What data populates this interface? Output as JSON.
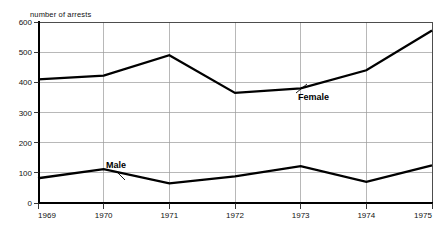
{
  "chart_data": {
    "type": "line",
    "title": "number of arrests",
    "xlabel": "",
    "ylabel": "number of arrests",
    "categories": [
      "1969",
      "1970",
      "1971",
      "1972",
      "1973",
      "1974",
      "1975"
    ],
    "x": [
      1969,
      1970,
      1971,
      1972,
      1973,
      1974,
      1975
    ],
    "xlim": [
      1969,
      1975
    ],
    "ylim": [
      0,
      600
    ],
    "yticks": [
      0,
      100,
      200,
      300,
      400,
      500,
      600
    ],
    "ytick_labels": [
      "0",
      "100",
      "200",
      "300",
      "400",
      "500",
      "600"
    ],
    "xtick_labels": [
      "1969",
      "1970",
      "1971",
      "1972",
      "1973",
      "1974",
      "1975"
    ],
    "grid": true,
    "legend": "inline-annotations",
    "series": [
      {
        "name": "Female",
        "label": "Female",
        "color": "#000000",
        "values": [
          410,
          422,
          490,
          365,
          380,
          440,
          572
        ],
        "annotation": {
          "text": "Female",
          "x_px": 298,
          "y_px": 100,
          "leader_from_x_px": 296,
          "leader_from_y_px": 93,
          "leader_to_x_px": 307,
          "leader_to_y_px": 84
        }
      },
      {
        "name": "Male",
        "label": "Male",
        "color": "#000000",
        "values": [
          82,
          112,
          65,
          88,
          122,
          70,
          125
        ],
        "annotation": {
          "text": "Male",
          "x_px": 106,
          "y_px": 168,
          "leader_from_x_px": 116,
          "leader_from_y_px": 171,
          "leader_to_x_px": 125,
          "leader_to_y_px": 180
        }
      }
    ]
  },
  "geometry": {
    "plot_left_px": 38,
    "plot_right_px": 432,
    "plot_top_px": 22,
    "plot_bottom_px": 203
  }
}
